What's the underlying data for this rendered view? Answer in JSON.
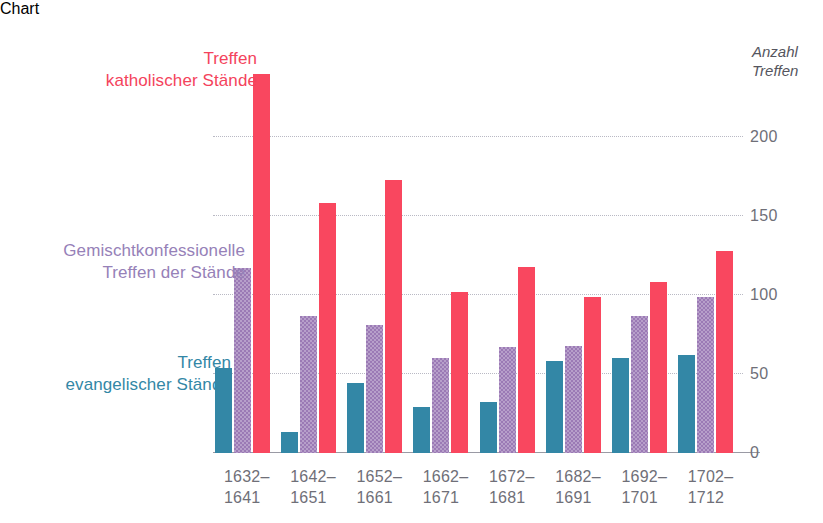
{
  "chart_data": {
    "type": "bar",
    "title": "",
    "subtitle": "",
    "xlabel": "",
    "ylabel": "Anzahl Treffen",
    "ylim": [
      0,
      250
    ],
    "yticks": [
      0,
      50,
      100,
      150,
      200
    ],
    "ytick_labels": [
      "0",
      "50",
      "100",
      "150",
      "200"
    ],
    "grid": "horizontal-dotted",
    "legend_position": "inline-callout-left",
    "categories": [
      "1632–\n1641",
      "1642–\n1651",
      "1652–\n1661",
      "1662–\n1671",
      "1672–\n1681",
      "1682–\n1691",
      "1692–\n1701",
      "1702–\n1712"
    ],
    "series": [
      {
        "name": "Treffen evangelischer Stände",
        "color": "#3387a6",
        "values": [
          54,
          13,
          44,
          29,
          32,
          58,
          60,
          62
        ]
      },
      {
        "name": "Gemischtkonfessionelle Treffen der Stände",
        "color": "#9b7ab5",
        "values": [
          117,
          87,
          81,
          60,
          67,
          68,
          87,
          99
        ]
      },
      {
        "name": "Treffen katholischer Stände",
        "color": "#f9475f",
        "values": [
          240,
          158,
          173,
          102,
          118,
          99,
          108,
          128
        ]
      }
    ]
  },
  "axis": {
    "y_title_line1": "Anzahl",
    "y_title_line2": "Treffen",
    "ticks": [
      {
        "label": "200",
        "value": 200
      },
      {
        "label": "150",
        "value": 150
      },
      {
        "label": "100",
        "value": 100
      },
      {
        "label": "50",
        "value": 50
      },
      {
        "label": "0",
        "value": 0
      }
    ]
  },
  "x_categories": [
    {
      "line1": "1632–",
      "line2": "1641"
    },
    {
      "line1": "1642–",
      "line2": "1651"
    },
    {
      "line1": "1652–",
      "line2": "1661"
    },
    {
      "line1": "1662–",
      "line2": "1671"
    },
    {
      "line1": "1672–",
      "line2": "1681"
    },
    {
      "line1": "1682–",
      "line2": "1691"
    },
    {
      "line1": "1692–",
      "line2": "1701"
    },
    {
      "line1": "1702–",
      "line2": "1712"
    }
  ],
  "legend": {
    "katholisch": {
      "line1": "Treffen",
      "line2": "katholischer Stände",
      "color": "#f4435c"
    },
    "gemischt": {
      "line1": "Gemischtkonfessionelle",
      "line2": "Treffen der Stände",
      "color": "#9681b8"
    },
    "evangelisch": {
      "line1": "Treffen",
      "line2": "evangelischer Stände",
      "color": "#3387a6"
    }
  },
  "colors": {
    "teal": "#3387a6",
    "purple": "#9b7ab5",
    "red": "#f9475f",
    "gridline": "#b9b9c4",
    "axis": "#9a9aa4",
    "tick_text": "#6f6f78"
  }
}
